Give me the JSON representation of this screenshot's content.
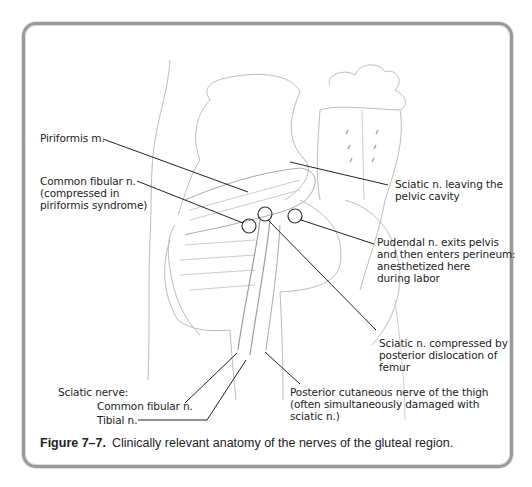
{
  "figure": {
    "number": "Figure 7–7.",
    "caption": "Clinically relevant anatomy of the nerves of the gluteal region."
  },
  "labels": {
    "piriformis": "Piriformis m.",
    "common_fibular_compressed": "Common fibular n.\n(compressed in\npiriformis syndrome)",
    "sciatic_leaving": "Sciatic n. leaving the\npelvic cavity",
    "pudendal": "Pudendal n. exits pelvis\nand then enters perineum:\nanesthetized here\nduring labor",
    "sciatic_compressed": "Sciatic n. compressed by\nposterior dislocation of\nfemur",
    "posterior_cutaneous": "Posterior cutaneous nerve of the thigh\n(often simultaneously damaged with\nsciatic n.)",
    "sciatic_nerve_heading": "Sciatic nerve:",
    "common_fibular": "Common fibular n.",
    "tibial": "Tibial n."
  },
  "colors": {
    "frame": "#9a9a9a",
    "line": "#222222",
    "sketch": "#b8b8b8"
  }
}
